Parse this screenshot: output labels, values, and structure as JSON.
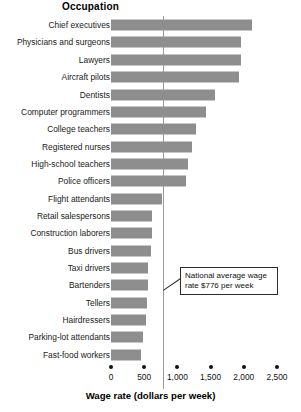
{
  "chart_data": {
    "type": "bar",
    "orientation": "horizontal",
    "title": "Occupation",
    "xlabel": "Wage rate (dollars per week)",
    "ylabel": "Occupation",
    "xlim": [
      0,
      2500
    ],
    "xticks": [
      0,
      500,
      1000,
      1500,
      2000,
      2500
    ],
    "xticklabels": [
      "0",
      "500",
      "1,000",
      "1,500",
      "2,000",
      "2,500"
    ],
    "grid": false,
    "legend": null,
    "bar_color": "#8e8e8e",
    "categories": [
      "Chief executives",
      "Physicians and surgeons",
      "Lawyers",
      "Aircraft pilots",
      "Dentists",
      "Computer programmers",
      "College teachers",
      "Registered nurses",
      "High-school teachers",
      "Police officers",
      "Flight attendants",
      "Retail salespersons",
      "Construction laborers",
      "Bus drivers",
      "Taxi drivers",
      "Bartenders",
      "Tellers",
      "Hairdressers",
      "Parking-lot attendants",
      "Fast-food workers"
    ],
    "values": [
      2125,
      1960,
      1960,
      1930,
      1570,
      1430,
      1280,
      1220,
      1160,
      1130,
      770,
      620,
      620,
      600,
      560,
      555,
      545,
      530,
      480,
      450
    ],
    "annotations": [
      {
        "name": "national-average-wage",
        "text": "National average wage rate $776 per week",
        "value": 776,
        "line_label": "national average reference line"
      }
    ]
  },
  "callout": {
    "line1": "National average wage",
    "line2": "rate $776 per week"
  }
}
